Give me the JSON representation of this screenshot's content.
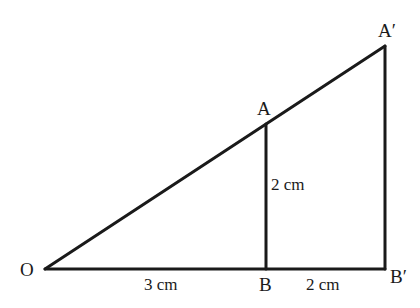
{
  "diagram": {
    "type": "similar-triangles",
    "points": {
      "O": {
        "label": "O",
        "x": 45,
        "y": 269
      },
      "B": {
        "label": "B",
        "x": 266,
        "y": 269
      },
      "B_prime": {
        "label": "B′",
        "x": 385,
        "y": 269
      },
      "A": {
        "label": "A",
        "x": 266,
        "y": 124
      },
      "A_prime": {
        "label": "A′",
        "x": 385,
        "y": 46
      }
    },
    "segments": [
      {
        "from": "O",
        "to": "B_prime"
      },
      {
        "from": "O",
        "to": "A_prime"
      },
      {
        "from": "B",
        "to": "A"
      },
      {
        "from": "B_prime",
        "to": "A_prime"
      }
    ],
    "dimensions": {
      "OB": "3 cm",
      "BB_prime": "2 cm",
      "AB": "2 cm"
    },
    "stroke_color": "#1a1a1a"
  }
}
